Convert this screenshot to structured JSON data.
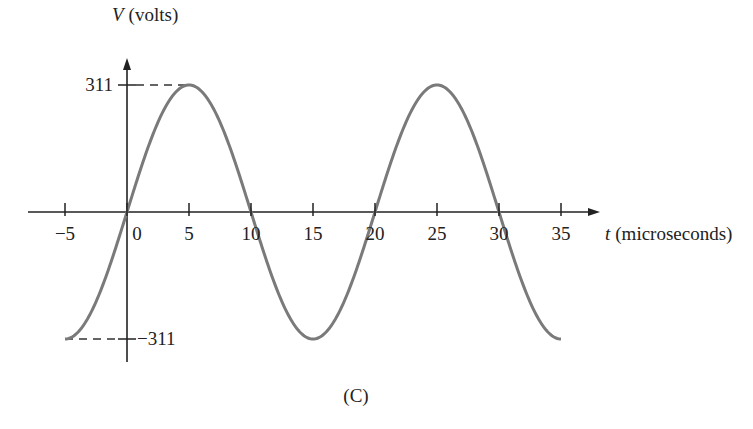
{
  "chart_data": {
    "type": "line",
    "title": "",
    "xlabel_var": "t",
    "xlabel_unit": "(microseconds)",
    "ylabel_var": "V",
    "ylabel_unit": "(volts)",
    "xlim": [
      -5,
      35
    ],
    "ylim": [
      -311,
      311
    ],
    "x_ticks": [
      -5,
      0,
      5,
      10,
      15,
      20,
      25,
      30,
      35
    ],
    "x_tick_labels": [
      "−5",
      "0",
      "5",
      "10",
      "15",
      "20",
      "25",
      "30",
      "35"
    ],
    "y_tick_labels": [
      "311",
      "−311"
    ],
    "y_ticks": [
      311,
      -311
    ],
    "series": [
      {
        "name": "V(t)",
        "function": "311*sin(2*pi*t/20)",
        "amplitude": 311,
        "period": 20,
        "x": [
          -5,
          0,
          5,
          10,
          15,
          20,
          25,
          30,
          35
        ],
        "values": [
          -311,
          0,
          311,
          0,
          -311,
          0,
          311,
          0,
          -311
        ],
        "color": "#7a7a7a"
      }
    ],
    "caption": "(C)",
    "grid": false
  }
}
